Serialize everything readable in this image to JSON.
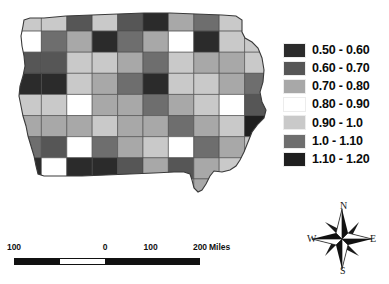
{
  "figure": {
    "type": "choropleth-map",
    "region": "Iowa counties"
  },
  "legend": {
    "name": "map-legend",
    "entries": [
      {
        "label": "0.50 - 0.60",
        "color": "#2b2b2b"
      },
      {
        "label": "0.60 - 0.70",
        "color": "#565656"
      },
      {
        "label": "0.70 - 0.80",
        "color": "#a8a8a8"
      },
      {
        "label": "0.80 - 0.90",
        "color": "#ffffff"
      },
      {
        "label": "0.90 - 1.0",
        "color": "#c9c9c9"
      },
      {
        "label": "1.0 - 1.10",
        "color": "#6e6e6e"
      },
      {
        "label": "1.10 - 1.20",
        "color": "#1f1f1f"
      }
    ]
  },
  "scalebar": {
    "name": "scale-bar",
    "ticks": [
      "100",
      "0",
      "100",
      "200"
    ],
    "units": "Miles"
  },
  "compass": {
    "north": "N",
    "east": "E",
    "south": "S",
    "west": "W"
  },
  "chart_data": {
    "type": "heatmap",
    "title": "",
    "xlabel": "",
    "ylabel": "",
    "legend_position": "right",
    "classes": [
      "0.50 - 0.60",
      "0.60 - 0.70",
      "0.70 - 0.80",
      "0.80 - 0.90",
      "0.90 - 1.0",
      "1.0 - 1.10",
      "1.10 - 1.20"
    ],
    "class_colors": [
      "#2b2b2b",
      "#565656",
      "#a8a8a8",
      "#ffffff",
      "#c9c9c9",
      "#6e6e6e",
      "#1f1f1f"
    ],
    "grid": false,
    "counties": [
      {
        "row": 0,
        "col": 0,
        "class": 4
      },
      {
        "row": 0,
        "col": 1,
        "class": 4
      },
      {
        "row": 0,
        "col": 2,
        "class": 1
      },
      {
        "row": 0,
        "col": 3,
        "class": 4
      },
      {
        "row": 0,
        "col": 4,
        "class": 1
      },
      {
        "row": 0,
        "col": 5,
        "class": 0
      },
      {
        "row": 0,
        "col": 6,
        "class": 2
      },
      {
        "row": 0,
        "col": 7,
        "class": 5
      },
      {
        "row": 0,
        "col": 8,
        "class": 4
      },
      {
        "row": 0,
        "col": 9,
        "class": 2
      },
      {
        "row": 1,
        "col": 0,
        "class": 3
      },
      {
        "row": 1,
        "col": 1,
        "class": 5
      },
      {
        "row": 1,
        "col": 2,
        "class": 2
      },
      {
        "row": 1,
        "col": 3,
        "class": 0
      },
      {
        "row": 1,
        "col": 4,
        "class": 5
      },
      {
        "row": 1,
        "col": 5,
        "class": 2
      },
      {
        "row": 1,
        "col": 6,
        "class": 3
      },
      {
        "row": 1,
        "col": 7,
        "class": 0
      },
      {
        "row": 1,
        "col": 8,
        "class": 4
      },
      {
        "row": 1,
        "col": 9,
        "class": 4
      },
      {
        "row": 2,
        "col": 0,
        "class": 1
      },
      {
        "row": 2,
        "col": 1,
        "class": 1
      },
      {
        "row": 2,
        "col": 2,
        "class": 4
      },
      {
        "row": 2,
        "col": 3,
        "class": 4
      },
      {
        "row": 2,
        "col": 4,
        "class": 2
      },
      {
        "row": 2,
        "col": 5,
        "class": 5
      },
      {
        "row": 2,
        "col": 6,
        "class": 4
      },
      {
        "row": 2,
        "col": 7,
        "class": 2
      },
      {
        "row": 2,
        "col": 8,
        "class": 2
      },
      {
        "row": 2,
        "col": 9,
        "class": 4
      },
      {
        "row": 3,
        "col": 0,
        "class": 0
      },
      {
        "row": 3,
        "col": 1,
        "class": 0
      },
      {
        "row": 3,
        "col": 2,
        "class": 4
      },
      {
        "row": 3,
        "col": 3,
        "class": 2
      },
      {
        "row": 3,
        "col": 4,
        "class": 5
      },
      {
        "row": 3,
        "col": 5,
        "class": 0
      },
      {
        "row": 3,
        "col": 6,
        "class": 4
      },
      {
        "row": 3,
        "col": 7,
        "class": 4
      },
      {
        "row": 3,
        "col": 8,
        "class": 2
      },
      {
        "row": 3,
        "col": 9,
        "class": 5
      },
      {
        "row": 4,
        "col": 0,
        "class": 4
      },
      {
        "row": 4,
        "col": 1,
        "class": 4
      },
      {
        "row": 4,
        "col": 2,
        "class": 3
      },
      {
        "row": 4,
        "col": 3,
        "class": 2
      },
      {
        "row": 4,
        "col": 4,
        "class": 2
      },
      {
        "row": 4,
        "col": 5,
        "class": 5
      },
      {
        "row": 4,
        "col": 6,
        "class": 2
      },
      {
        "row": 4,
        "col": 7,
        "class": 4
      },
      {
        "row": 4,
        "col": 8,
        "class": 3
      },
      {
        "row": 4,
        "col": 9,
        "class": 1
      },
      {
        "row": 5,
        "col": 0,
        "class": 2
      },
      {
        "row": 5,
        "col": 1,
        "class": 2
      },
      {
        "row": 5,
        "col": 2,
        "class": 2
      },
      {
        "row": 5,
        "col": 3,
        "class": 4
      },
      {
        "row": 5,
        "col": 4,
        "class": 2
      },
      {
        "row": 5,
        "col": 5,
        "class": 2
      },
      {
        "row": 5,
        "col": 6,
        "class": 5
      },
      {
        "row": 5,
        "col": 7,
        "class": 2
      },
      {
        "row": 5,
        "col": 8,
        "class": 4
      },
      {
        "row": 5,
        "col": 9,
        "class": 6
      },
      {
        "row": 6,
        "col": 0,
        "class": 5
      },
      {
        "row": 6,
        "col": 1,
        "class": 1
      },
      {
        "row": 6,
        "col": 2,
        "class": 3
      },
      {
        "row": 6,
        "col": 3,
        "class": 5
      },
      {
        "row": 6,
        "col": 4,
        "class": 2
      },
      {
        "row": 6,
        "col": 5,
        "class": 4
      },
      {
        "row": 6,
        "col": 6,
        "class": 3
      },
      {
        "row": 6,
        "col": 7,
        "class": 5
      },
      {
        "row": 6,
        "col": 8,
        "class": 2
      },
      {
        "row": 6,
        "col": 9,
        "class": 4
      },
      {
        "row": 7,
        "col": 0,
        "class": 0
      },
      {
        "row": 7,
        "col": 1,
        "class": 3
      },
      {
        "row": 7,
        "col": 2,
        "class": 0
      },
      {
        "row": 7,
        "col": 3,
        "class": 0
      },
      {
        "row": 7,
        "col": 4,
        "class": 1
      },
      {
        "row": 7,
        "col": 5,
        "class": 2
      },
      {
        "row": 7,
        "col": 6,
        "class": 1
      },
      {
        "row": 7,
        "col": 7,
        "class": 2
      },
      {
        "row": 7,
        "col": 8,
        "class": 4
      },
      {
        "row": 7,
        "col": 9,
        "class": 4
      },
      {
        "row": 8,
        "col": 0,
        "class": 1
      },
      {
        "row": 8,
        "col": 1,
        "class": 0
      },
      {
        "row": 8,
        "col": 2,
        "class": 2
      },
      {
        "row": 8,
        "col": 3,
        "class": 3
      },
      {
        "row": 8,
        "col": 4,
        "class": 5
      },
      {
        "row": 8,
        "col": 5,
        "class": 2
      },
      {
        "row": 8,
        "col": 6,
        "class": 4
      },
      {
        "row": 8,
        "col": 7,
        "class": 2
      },
      {
        "row": 8,
        "col": 8,
        "class": 2
      },
      {
        "row": 8,
        "col": 9,
        "class": 4
      }
    ]
  }
}
